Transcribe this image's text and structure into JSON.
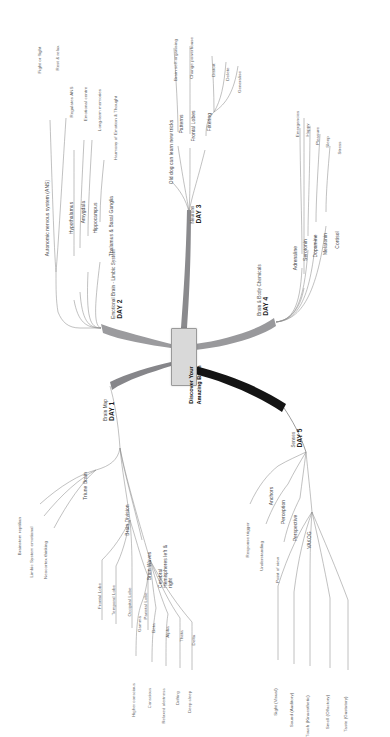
{
  "diagram": {
    "type": "mind-map",
    "orientation": "rotated-90-ccw",
    "center": {
      "line1": "Discover Your",
      "line2": "Amazing Brain"
    },
    "palette": {
      "center_fill": "#d9d9d9",
      "center_stroke": "#9a9a9a",
      "branch": "#8d8d8d",
      "trunk_dark": "#6f6f72",
      "trunk_black": "#111111"
    },
    "branches": [
      {
        "id": "day1",
        "day": "DAY 1",
        "title": "Brain Map",
        "children": [
          {
            "label": "Triune Brain",
            "children": [
              {
                "label": "Brainstem reptilian"
              },
              {
                "label": "Limbic System emotional"
              },
              {
                "label": "Neocortex thinking"
              }
            ]
          },
          {
            "label": "Brain Division",
            "children": [
              {
                "label": "Frontal Lobe"
              },
              {
                "label": "Temporal Lobe"
              },
              {
                "label": "Occipital Lobe"
              },
              {
                "label": "Parietal Lobe"
              }
            ]
          },
          {
            "label": "Cerebral Hemispheres left & right",
            "children": []
          },
          {
            "label": "Brain Waves",
            "children": [
              {
                "label": "Gamma",
                "leaf": "Higher conscious"
              },
              {
                "label": "Beta",
                "leaf": "Conscious"
              },
              {
                "label": "Alpha",
                "leaf": "Relaxed alertness"
              },
              {
                "label": "Theta",
                "leaf": "Drifting"
              },
              {
                "label": "Delta",
                "leaf": "Deep sleep"
              }
            ]
          }
        ]
      },
      {
        "id": "day2",
        "day": "DAY 2",
        "title": "Emotional Brain - Limbic System",
        "children": [
          {
            "label": "Autonomic nervous system (ANS)",
            "children": [
              {
                "label": "Fight or flight"
              },
              {
                "label": "Rest & relax"
              }
            ]
          },
          {
            "label": "Hypothalamus",
            "children": [
              {
                "label": "Regulates ANS"
              }
            ]
          },
          {
            "label": "Amygdala",
            "children": [
              {
                "label": "Emotional centre"
              }
            ]
          },
          {
            "label": "Hippocampus",
            "children": [
              {
                "label": "Long-term memories"
              }
            ]
          },
          {
            "label": "Thalamus & Basal Ganglia",
            "children": [
              {
                "label": "Harmony of Emotion & Thought"
              }
            ]
          }
        ]
      },
      {
        "id": "day3",
        "day": "DAY 3",
        "title": "Neurons",
        "children": [
          {
            "label": "Old dog can learn new tricks",
            "children": []
          },
          {
            "label": "Patterns",
            "children": [
              {
                "label": "Brain self-organising"
              }
            ]
          },
          {
            "label": "Frontal Lobes",
            "children": [
              {
                "label": "Change powerhouse"
              }
            ]
          },
          {
            "label": "Filtering",
            "children": [
              {
                "label": "Distort"
              },
              {
                "label": "Delete"
              },
              {
                "label": "Generalise"
              }
            ]
          }
        ]
      },
      {
        "id": "day4",
        "day": "DAY 4",
        "title": "Brain & Body Chemicals",
        "children": [
          {
            "label": "Adrenaline",
            "children": [
              {
                "label": "Emergencies"
              }
            ]
          },
          {
            "label": "Serotonin",
            "children": [
              {
                "label": "Happy"
              }
            ]
          },
          {
            "label": "Dopamine",
            "children": [
              {
                "label": "Pleasure"
              }
            ]
          },
          {
            "label": "Melatonin",
            "children": [
              {
                "label": "Sleep"
              }
            ]
          },
          {
            "label": "Cortisol",
            "children": [
              {
                "label": "Stress"
              }
            ]
          }
        ]
      },
      {
        "id": "day5",
        "day": "DAY 5",
        "title": "Senses",
        "children": [
          {
            "label": "Anchors",
            "children": [
              {
                "label": "Response trigger"
              }
            ]
          },
          {
            "label": "Perception",
            "children": [
              {
                "label": "Understanding"
              }
            ]
          },
          {
            "label": "Perspective",
            "children": [
              {
                "label": "Point of view"
              }
            ]
          },
          {
            "label": "VAKOG",
            "children": [
              {
                "label": "Sight (Visual)"
              },
              {
                "label": "Sound (Auditory)"
              },
              {
                "label": "Touch (Kinaesthetic)"
              },
              {
                "label": "Smell (Olfactory)"
              },
              {
                "label": "Taste (Gustatory)"
              }
            ]
          }
        ]
      }
    ]
  }
}
